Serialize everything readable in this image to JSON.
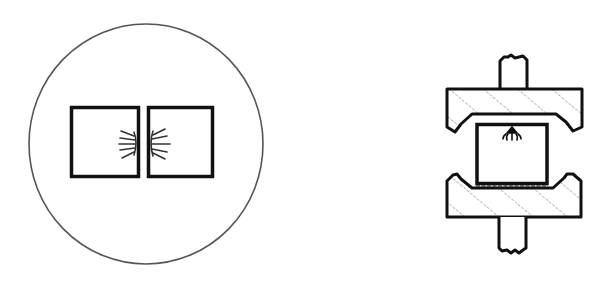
{
  "diagram": {
    "background": "#ffffff",
    "stroke_color": "#111111",
    "circle_stroke_color": "#555555",
    "hatch_color": "#666666",
    "left_figure": {
      "description": "two square specimens side by side inside a circle, with radiating marks at the facing edges",
      "circle": {
        "cx": 146,
        "cy": 144,
        "rx": 117,
        "ry": 120
      },
      "squares": [
        {
          "x": 71,
          "y": 107,
          "w": 68,
          "h": 70
        },
        {
          "x": 147,
          "y": 107,
          "w": 66,
          "h": 70
        }
      ]
    },
    "right_figure": {
      "description": "specimen compressed between two hatched press plates with shafts above and below",
      "specimen": {
        "x": 476,
        "y": 124,
        "w": 71,
        "h": 60
      },
      "arrow_marker": {
        "x": 512,
        "y": 128
      }
    }
  }
}
